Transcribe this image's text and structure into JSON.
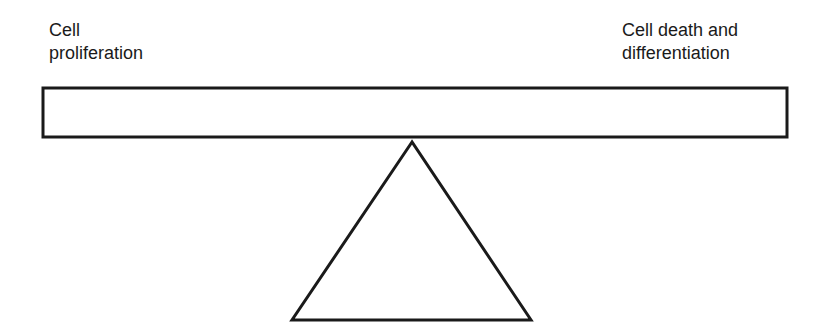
{
  "diagram": {
    "type": "balance-seesaw",
    "left_label": "Cell\nproliferation",
    "right_label": "Cell death and\ndifferentiation",
    "beam": {
      "x": 43,
      "y": 88,
      "width": 744,
      "height": 49
    },
    "fulcrum": {
      "apex": [
        412,
        142
      ],
      "base_left": [
        292,
        320
      ],
      "base_right": [
        531,
        320
      ]
    },
    "stroke_color": "#1a1a1a",
    "background": "#ffffff"
  }
}
